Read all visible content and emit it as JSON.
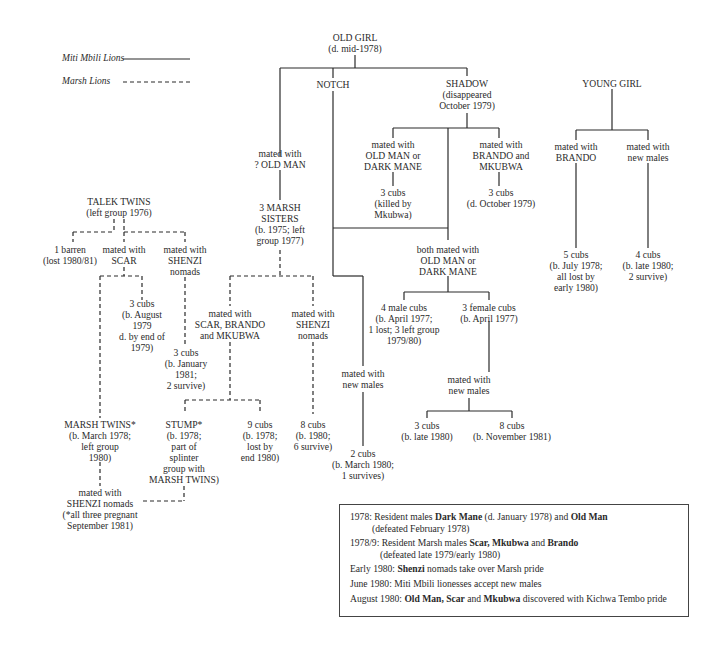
{
  "legend": {
    "items": [
      {
        "label": "Miti Mbili Lions",
        "style": "solid"
      },
      {
        "label": "Marsh Lions",
        "style": "dashed"
      }
    ]
  },
  "nodes": {
    "old_girl": [
      "OLD GIRL",
      "(d. mid-1978)"
    ],
    "notch": [
      "NOTCH"
    ],
    "shadow": [
      "SHADOW",
      "(disappeared",
      "October 1979)"
    ],
    "young_girl": [
      "YOUNG GIRL"
    ],
    "notch_mated_old_man": [
      "mated with",
      "? OLD MAN"
    ],
    "marsh_sisters": [
      "3 MARSH",
      "SISTERS",
      "(b. 1975; left",
      "group 1977)"
    ],
    "shadow_mated_1": [
      "mated with",
      "OLD MAN or",
      "DARK MANE"
    ],
    "shadow_cubs_1": [
      "3 cubs",
      "(killed by",
      "Mkubwa)"
    ],
    "shadow_mated_2": [
      "mated with",
      "BRANDO and",
      "MKUBWA"
    ],
    "shadow_cubs_2": [
      "3 cubs",
      "(d. October 1979)"
    ],
    "yg_mated_brando": [
      "mated with",
      "BRANDO"
    ],
    "yg_mated_new": [
      "mated with",
      "new males"
    ],
    "yg_cubs_1": [
      "5 cubs",
      "(b. July 1978;",
      "all lost by",
      "early 1980)"
    ],
    "yg_cubs_2": [
      "4 cubs",
      "(b. late 1980;",
      "2 survive)"
    ],
    "talek_twins": [
      "TALEK TWINS",
      "(left group 1976)"
    ],
    "barren": [
      "1 barren",
      "(lost 1980/81)"
    ],
    "tt_mated_scar": [
      "mated with",
      "SCAR"
    ],
    "tt_mated_shenzi": [
      "mated with",
      "SHENZI",
      "nomads"
    ],
    "tt_cubs_aug": [
      "3 cubs",
      "(b. August",
      "1979",
      "d. by end of",
      "1979)"
    ],
    "tt_cubs_jan": [
      "3 cubs",
      "(b. January",
      "1981;",
      "2 survive)"
    ],
    "ms_mated_scar": [
      "mated with",
      "SCAR, BRANDO",
      "and MKUBWA"
    ],
    "ms_mated_shenzi": [
      "mated with",
      "SHENZI",
      "nomads"
    ],
    "both_mated": [
      "both mated with",
      "OLD MAN or",
      "DARK MANE"
    ],
    "male_cubs": [
      "4 male cubs",
      "(b. April 1977;",
      "1 lost; 3 left group",
      "1979/80)"
    ],
    "female_cubs": [
      "3 female cubs",
      "(b. April 1977)"
    ],
    "marsh_twins": [
      "MARSH TWINS*",
      "(b. March 1978;",
      "left group",
      "1980)"
    ],
    "stump": [
      "STUMP*",
      "(b. 1978;",
      "part of",
      "splinter",
      "group with",
      "MARSH TWINS)"
    ],
    "ms_cubs_9": [
      "9 cubs",
      "(b. 1978;",
      "lost by",
      "end 1980)"
    ],
    "ms_cubs_8": [
      "8 cubs",
      "(b. 1980;",
      "6 survive)"
    ],
    "notch_mated_new": [
      "mated with",
      "new males"
    ],
    "notch_cubs": [
      "2 cubs",
      "(b. March 1980;",
      "1 survives)"
    ],
    "fc_mated_new": [
      "mated with",
      "new males"
    ],
    "fc_cubs_3": [
      "3 cubs",
      "(b. late 1980)"
    ],
    "fc_cubs_8": [
      "8 cubs",
      "(b. November 1981)"
    ],
    "mt_mated_shenzi": [
      "mated with",
      "SHENZI nomads",
      "(*all three pregnant",
      "September 1981)"
    ]
  },
  "notes": [
    {
      "parts": [
        [
          "1978: Resident males ",
          false
        ],
        [
          "Dark Mane",
          true
        ],
        [
          " (d. January 1978) and ",
          false
        ],
        [
          "Old Man",
          true
        ]
      ],
      "cont": "(defeated February 1978)"
    },
    {
      "parts": [
        [
          "1978/9: Resident Marsh males ",
          false
        ],
        [
          "Scar, Mkubwa",
          true
        ],
        [
          " and ",
          false
        ],
        [
          "Brando",
          true
        ]
      ],
      "cont": "(defeated late 1979/early 1980)"
    },
    {
      "parts": [
        [
          "Early 1980: ",
          false
        ],
        [
          "Shenzi",
          true
        ],
        [
          " nomads take over Marsh pride",
          false
        ]
      ]
    },
    {
      "parts": [
        [
          "June 1980: Miti Mbili lionesses accept new males",
          false
        ]
      ]
    },
    {
      "parts": [
        [
          "August 1980: ",
          false
        ],
        [
          "Old Man, Scar",
          true
        ],
        [
          " and ",
          false
        ],
        [
          "Mkubwa",
          true
        ],
        [
          " discovered with Kichwa Tembo pride",
          false
        ]
      ]
    }
  ],
  "colors": {
    "line": "#2a2a2a",
    "text": "#2a2a2a",
    "background": "#ffffff"
  }
}
